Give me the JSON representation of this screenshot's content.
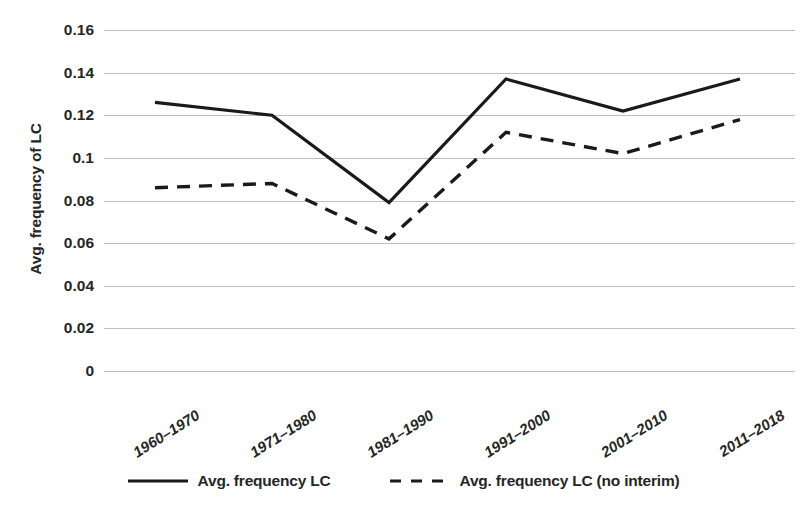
{
  "chart_data": {
    "type": "line",
    "title": "",
    "xlabel": "",
    "ylabel": "Avg. frequency of LC",
    "categories": [
      "1960–1970",
      "1971–1980",
      "1981–1990",
      "1991–2000",
      "2001–2010",
      "2011–2018"
    ],
    "series": [
      {
        "name": "Avg. frequency LC",
        "style": "solid",
        "color": "#1a1a1a",
        "values": [
          0.126,
          0.12,
          0.079,
          0.137,
          0.122,
          0.137
        ]
      },
      {
        "name": "Avg. frequency LC (no interim)",
        "style": "dashed",
        "color": "#1a1a1a",
        "values": [
          0.086,
          0.088,
          0.062,
          0.112,
          0.102,
          0.118
        ]
      }
    ],
    "ylim": [
      0,
      0.16
    ],
    "ytick_labels": [
      "0.16",
      "0.14",
      "0.12",
      "0.1",
      "0.08",
      "0.06",
      "0.04",
      "0.02",
      "0"
    ],
    "ytick_values": [
      0.16,
      0.14,
      0.12,
      0.1,
      0.08,
      0.06,
      0.04,
      0.02,
      0
    ],
    "grid": true,
    "grid_color": "#bfbfbf",
    "legend_position": "bottom",
    "x_tick_rotation_deg": -32
  },
  "legend": {
    "items": [
      {
        "label": "Avg. frequency LC",
        "style": "solid"
      },
      {
        "label": "Avg. frequency LC (no interim)",
        "style": "dashed"
      }
    ]
  }
}
